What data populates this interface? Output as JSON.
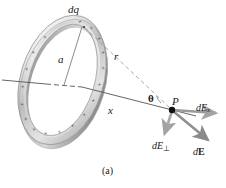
{
  "figure": {
    "caption": "(a)",
    "background_color": "#ffffff"
  },
  "labels": {
    "charge_element": "dq",
    "radius": "a",
    "distance_to_point": "r",
    "axial_distance": "x",
    "angle": "θ",
    "point": "P",
    "field_axial_prefix": "dE",
    "field_axial_subscript": "x",
    "field_perp_prefix": "dE",
    "field_perp_subscript": "⊥",
    "field_total_prefix": "d",
    "field_total_vector": "E"
  },
  "ring": {
    "charge_symbol": "+",
    "charge_count": 18,
    "band_color_light": "#f2f2f2",
    "band_color_mid": "#c8c8c8",
    "band_color_dark": "#9a9a9a",
    "outline_color": "#8c8c8c",
    "center_x": 62,
    "center_y": 80,
    "radius_x": 37,
    "radius_y": 62,
    "rotation_deg": 17
  },
  "geometry": {
    "point_p_x": 172,
    "point_p_y": 110,
    "ring_top_x": 84,
    "ring_top_y": 26,
    "axis_line_color": "#555555",
    "dashed_line_color": "#999999",
    "arrow_color": "#9b9b9b",
    "point_color": "#111111"
  },
  "vectors": [
    {
      "name": "dE_x",
      "description": "axial component arrow pointing right",
      "from": [
        172,
        110
      ],
      "to": [
        219,
        113
      ],
      "color": "#9b9b9b"
    },
    {
      "name": "dE_perp",
      "description": "perpendicular component arrow pointing down",
      "from": [
        172,
        110
      ],
      "to": [
        164,
        137
      ],
      "color": "#a8a8a8"
    },
    {
      "name": "dE",
      "description": "resultant field arrow pointing down-right",
      "from": [
        172,
        110
      ],
      "to": [
        211,
        143
      ],
      "color": "#8f8f8f"
    }
  ]
}
